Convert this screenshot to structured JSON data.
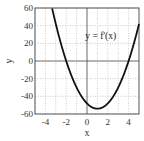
{
  "chart_data": {
    "type": "line",
    "title": "",
    "xlabel": "x",
    "ylabel": "y",
    "xlim": [
      -5,
      5
    ],
    "ylim": [
      -60,
      60
    ],
    "xticks": [
      -4,
      -2,
      0,
      2,
      4
    ],
    "yticks": [
      -60,
      -40,
      -20,
      0,
      20,
      40,
      60
    ],
    "grid": true,
    "grid_minor_x": [
      -5,
      -3,
      -1,
      1,
      3
    ],
    "series": [
      {
        "name": "y = f'(x)",
        "function": "6*(x+2)*(x-4)",
        "x": [
          -3.6,
          -3,
          -2,
          -1,
          0,
          1,
          2,
          3,
          4,
          5
        ],
        "y": [
          60,
          42,
          0,
          -30,
          -48,
          -54,
          -48,
          -30,
          0,
          42
        ],
        "color": "#111111"
      }
    ],
    "annotations": [
      {
        "text": "y = f'(x)",
        "x": 2.9,
        "y": 28
      }
    ]
  }
}
